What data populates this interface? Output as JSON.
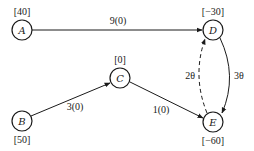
{
  "diagram": {
    "type": "network-flow",
    "nodes": [
      {
        "id": "A",
        "label": "A",
        "supply": "[40]"
      },
      {
        "id": "B",
        "label": "B",
        "supply": "[50]"
      },
      {
        "id": "C",
        "label": "C",
        "supply": "[0]"
      },
      {
        "id": "D",
        "label": "D",
        "supply": "[−30]"
      },
      {
        "id": "E",
        "label": "E",
        "supply": "[−60]"
      }
    ],
    "edges": [
      {
        "from": "A",
        "to": "D",
        "label": "9(0)",
        "style": "solid"
      },
      {
        "from": "B",
        "to": "C",
        "label": "3(0)",
        "style": "solid"
      },
      {
        "from": "C",
        "to": "E",
        "label": "1(0)",
        "style": "solid"
      },
      {
        "from": "D",
        "to": "E",
        "label": "3θ",
        "style": "solid"
      },
      {
        "from": "E",
        "to": "D",
        "label": "2θ",
        "style": "dashed"
      }
    ]
  }
}
